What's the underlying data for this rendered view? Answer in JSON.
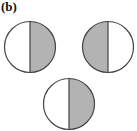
{
  "panel_label": "(b)",
  "colors": {
    "stroke": "#444444",
    "shade": "#b3b3b3",
    "fill": "#ffffff"
  },
  "circles": [
    {
      "id": "top-left",
      "cx": 30,
      "cy": 47,
      "r": 25.5,
      "shaded_half": "right"
    },
    {
      "id": "top-right",
      "cx": 108,
      "cy": 47,
      "r": 25.5,
      "shaded_half": "left"
    },
    {
      "id": "bottom",
      "cx": 69,
      "cy": 104,
      "r": 25.5,
      "shaded_half": "right"
    }
  ]
}
